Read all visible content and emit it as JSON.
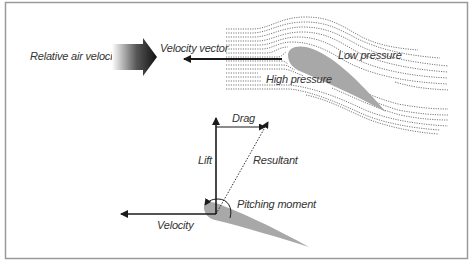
{
  "figure": {
    "top_diagram": {
      "relative_air_velocity_label": "Relative air velocity",
      "velocity_vector_label": "Velocity vector",
      "low_pressure_label": "Low pressure",
      "high_pressure_label": "High pressure"
    },
    "force_diagram": {
      "drag_label": "Drag",
      "lift_label": "Lift",
      "resultant_label": "Resultant",
      "pitching_moment_label": "Pitching moment",
      "velocity_label": "Velocity"
    },
    "colors": {
      "airfoil": "#a8a8a8",
      "lines": "#1a1a1a",
      "streamlines": "#555555",
      "border": "#9a9a9a"
    }
  }
}
